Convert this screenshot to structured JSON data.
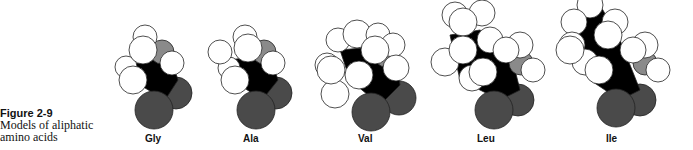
{
  "caption": {
    "figure": "Figure 2-9",
    "text_line1": "Models of aliphatic",
    "text_line2": "amino acids"
  },
  "models": [
    {
      "label": "Gly",
      "x": 145
    },
    {
      "label": "Ala",
      "x": 243
    },
    {
      "label": "Val",
      "x": 358
    },
    {
      "label": "Leu",
      "x": 482
    },
    {
      "label": "Ile",
      "x": 609
    }
  ],
  "colors": {
    "dark": "#4a4a4a",
    "black": "#000000",
    "gray": "#8a8a8a",
    "white": "#ffffff"
  }
}
